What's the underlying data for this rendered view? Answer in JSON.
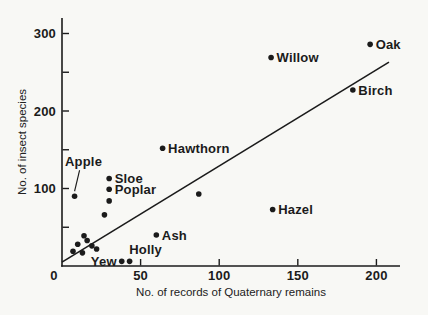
{
  "colors": {
    "ink": "#1b1b1b",
    "background": "#f8f8f5"
  },
  "chart_data": {
    "type": "scatter",
    "title": "",
    "xlabel": "No. of records of Quaternary remains",
    "ylabel": "No. of insect species",
    "xlim": [
      0,
      215
    ],
    "ylim": [
      0,
      320
    ],
    "grid": false,
    "legend": false,
    "x_ticks": [
      {
        "value": 0,
        "label": "0",
        "mark": false,
        "label_dx": -8
      },
      {
        "value": 50,
        "label": "50",
        "mark": true,
        "label_dx": 0
      },
      {
        "value": 100,
        "label": "100",
        "mark": true,
        "label_dx": 0
      },
      {
        "value": 150,
        "label": "150",
        "mark": true,
        "label_dx": 0
      },
      {
        "value": 200,
        "label": "200",
        "mark": true,
        "label_dx": 0
      }
    ],
    "y_ticks": [
      {
        "value": 50,
        "label": "",
        "mark": true
      },
      {
        "value": 100,
        "label": "100",
        "mark": true
      },
      {
        "value": 150,
        "label": "",
        "mark": true
      },
      {
        "value": 200,
        "label": "200",
        "mark": true
      },
      {
        "value": 250,
        "label": "",
        "mark": true
      },
      {
        "value": 300,
        "label": "300",
        "mark": true
      }
    ],
    "points": [
      {
        "label": "Oak",
        "x": 196,
        "y": 286,
        "label_pos": "right"
      },
      {
        "label": "Willow",
        "x": 133,
        "y": 269,
        "label_pos": "right"
      },
      {
        "label": "Birch",
        "x": 185,
        "y": 227,
        "label_pos": "right"
      },
      {
        "label": "Hawthorn",
        "x": 64,
        "y": 152,
        "label_pos": "right"
      },
      {
        "label": "Sloe",
        "x": 30,
        "y": 113,
        "label_pos": "right"
      },
      {
        "label": "Poplar",
        "x": 30,
        "y": 99,
        "label_pos": "right"
      },
      {
        "label": "Hazel",
        "x": 134,
        "y": 73,
        "label_pos": "right"
      },
      {
        "label": "Ash",
        "x": 60,
        "y": 40,
        "label_pos": "right"
      },
      {
        "label": "Apple",
        "x": 8,
        "y": 90,
        "label_pos": "above",
        "label_dx": 9,
        "label_dy": -35,
        "leader": {
          "from_dx": 5,
          "from_dy": -26,
          "to_dx": 0,
          "to_dy": -5
        }
      },
      {
        "label": "Holly",
        "x": 43,
        "y": 6,
        "label_pos": "above",
        "label_dx": 16,
        "label_dy": -12
      },
      {
        "label": "Yew",
        "x": 38,
        "y": 6,
        "label_pos": "left"
      },
      {
        "label": "",
        "x": 87,
        "y": 93
      },
      {
        "label": "",
        "x": 30,
        "y": 84
      },
      {
        "label": "",
        "x": 27,
        "y": 66
      },
      {
        "label": "",
        "x": 14,
        "y": 39
      },
      {
        "label": "",
        "x": 16,
        "y": 33
      },
      {
        "label": "",
        "x": 10,
        "y": 28
      },
      {
        "label": "",
        "x": 19,
        "y": 26
      },
      {
        "label": "",
        "x": 22,
        "y": 22
      },
      {
        "label": "",
        "x": 7,
        "y": 19
      },
      {
        "label": "",
        "x": 13,
        "y": 17
      }
    ],
    "trend_line": {
      "x1": 0,
      "y1": 5,
      "x2": 208,
      "y2": 263
    }
  }
}
